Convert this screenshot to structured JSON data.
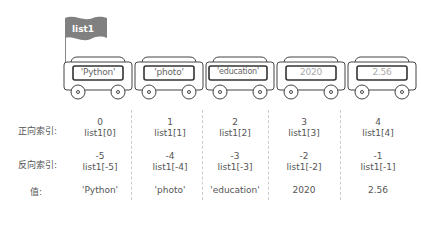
{
  "title": "list1",
  "cars": [
    {
      "label": "'Python'",
      "faded": false
    },
    {
      "label": "'photo'",
      "faded": false
    },
    {
      "label": "'education'",
      "faded": false
    },
    {
      "label": "2020",
      "faded": true
    },
    {
      "label": "2.56",
      "faded": true
    }
  ],
  "rows": {
    "forward_label": "正向索引:",
    "reverse_label": "反向索引:",
    "value_label": "值:"
  },
  "columns": [
    {
      "fwd_num": "0",
      "fwd_expr": "list1[0]",
      "rev_num": "-5",
      "rev_expr": "list1[-5]",
      "value": "'Python'"
    },
    {
      "fwd_num": "1",
      "fwd_expr": "list1[1]",
      "rev_num": "-4",
      "rev_expr": "list1[-4]",
      "value": "'photo'"
    },
    {
      "fwd_num": "2",
      "fwd_expr": "list1[2]",
      "rev_num": "-3",
      "rev_expr": "list1[-3]",
      "value": "'education'"
    },
    {
      "fwd_num": "3",
      "fwd_expr": "list1[3]",
      "rev_num": "-2",
      "rev_expr": "list1[-2]",
      "value": "2020"
    },
    {
      "fwd_num": "4",
      "fwd_expr": "list1[4]",
      "rev_num": "-1",
      "rev_expr": "list1[-1]",
      "value": "2.56"
    }
  ],
  "colors": {
    "flag": "#808080",
    "outline": "#444444",
    "divider": "#cccccc"
  }
}
